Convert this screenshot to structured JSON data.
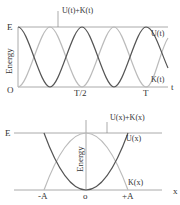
{
  "top_chart": {
    "title_label": "U(t)+K(t)",
    "y_axis_label": "Energy",
    "y_top_label": "E",
    "origin_label": "O",
    "x_axis_label": "t",
    "x_ticks": [
      "T/2",
      "T"
    ],
    "curve_labels": {
      "potential": "U(t)",
      "kinetic": "K(t)"
    }
  },
  "bottom_chart": {
    "title_label": "U(x)+K(x)",
    "y_axis_label": "Energy",
    "y_top_label": "E",
    "x_axis_label": "x",
    "x_ticks": [
      "-A",
      "o",
      "+A"
    ],
    "curve_labels": {
      "potential": "U(x)",
      "kinetic": "K(x)"
    }
  },
  "colors": {
    "dark_curve": "#555555",
    "light_curve": "#bbbbbb",
    "axis": "#999999"
  }
}
